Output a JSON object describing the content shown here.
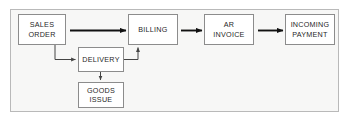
{
  "diagram": {
    "type": "flowchart",
    "canvas": {
      "width": 348,
      "height": 120
    },
    "frame": {
      "background_color": "#f7f7f6",
      "border_color": "#b9b9b9"
    },
    "style": {
      "node_fill": "#ffffff",
      "node_border": "#8c8c8c",
      "arrow_color": "#111111",
      "connector_color": "#555555",
      "text_color": "#1f1f1f"
    },
    "nodes": [
      {
        "id": "sales-order",
        "label": "SALES\nORDER",
        "x": 18,
        "y": 14,
        "width": 48,
        "height": 31
      },
      {
        "id": "billing",
        "label": "BILLING",
        "x": 128,
        "y": 14,
        "width": 50,
        "height": 31
      },
      {
        "id": "ar-invoice",
        "label": "AR\nINVOICE",
        "x": 204,
        "y": 14,
        "width": 50,
        "height": 31
      },
      {
        "id": "incoming-payment",
        "label": "INCOMING\nPAYMENT",
        "x": 285,
        "y": 14,
        "width": 50,
        "height": 31
      },
      {
        "id": "delivery",
        "label": "DELIVERY",
        "x": 78,
        "y": 47,
        "width": 46,
        "height": 25
      },
      {
        "id": "goods-issue",
        "label": "GOODS\nISSUE",
        "x": 78,
        "y": 82,
        "width": 46,
        "height": 26
      }
    ],
    "edges": [
      {
        "id": "sales-order-to-billing",
        "from": "sales-order",
        "to": "billing",
        "style": "thick-straight"
      },
      {
        "id": "billing-to-ar-invoice",
        "from": "billing",
        "to": "ar-invoice",
        "style": "thick-straight"
      },
      {
        "id": "ar-invoice-to-incoming-payment",
        "from": "ar-invoice",
        "to": "incoming-payment",
        "style": "thick-straight"
      },
      {
        "id": "sales-order-to-delivery",
        "from": "sales-order",
        "to": "delivery",
        "style": "thin-elbow"
      },
      {
        "id": "delivery-to-billing",
        "from": "delivery",
        "to": "billing",
        "style": "thin-elbow"
      },
      {
        "id": "delivery-to-goods-issue",
        "from": "delivery",
        "to": "goods-issue",
        "style": "thin-straight"
      }
    ]
  }
}
